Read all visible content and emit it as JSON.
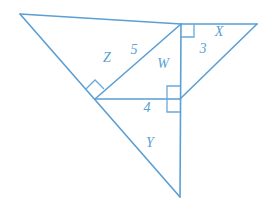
{
  "figure": {
    "name": "geometry-diagram-right-triangles",
    "stroke_color": "#5b9fd4",
    "background_color": "#ffffff",
    "labels": [
      {
        "id": "Z",
        "text": "Z",
        "x": 107,
        "y": 58,
        "kind": "variable"
      },
      {
        "id": "5",
        "text": "5",
        "x": 134,
        "y": 50,
        "kind": "measure"
      },
      {
        "id": "W",
        "text": "W",
        "x": 163,
        "y": 64,
        "kind": "variable"
      },
      {
        "id": "X",
        "text": "X",
        "x": 219,
        "y": 32,
        "kind": "variable"
      },
      {
        "id": "3",
        "text": "3",
        "x": 203,
        "y": 49,
        "kind": "measure"
      },
      {
        "id": "4",
        "text": "4",
        "x": 147,
        "y": 108,
        "kind": "measure"
      },
      {
        "id": "Y",
        "text": "Y",
        "x": 150,
        "y": 143,
        "kind": "variable"
      }
    ],
    "vertices": {
      "A_top_left": {
        "x": 20,
        "y": 14
      },
      "B_apex": {
        "x": 181,
        "y": 24
      },
      "C_top_right": {
        "x": 257,
        "y": 24
      },
      "D_left_interior": {
        "x": 95,
        "y": 99
      },
      "E_center": {
        "x": 180,
        "y": 99
      },
      "F_bottom": {
        "x": 180,
        "y": 197
      }
    },
    "segments": [
      {
        "name": "top-edge",
        "from": "A_top_left",
        "to": "B_apex"
      },
      {
        "name": "top-right-edge",
        "from": "B_apex",
        "to": "C_top_right"
      },
      {
        "name": "long-left-diagonal",
        "from": "A_top_left",
        "to": "F_bottom"
      },
      {
        "name": "vertical-altitude",
        "from": "B_apex",
        "to": "F_bottom"
      },
      {
        "name": "right-diagonal",
        "from": "C_top_right",
        "to": "E_center"
      },
      {
        "name": "hypotenuse-5",
        "from": "D_left_interior",
        "to": "B_apex"
      },
      {
        "name": "base-4",
        "from": "D_left_interior",
        "to": "E_center"
      }
    ],
    "right_angle_marks": [
      {
        "name": "right-angle-apex",
        "at": "B_apex"
      },
      {
        "name": "right-angle-left-interior",
        "at": "D_left_interior"
      },
      {
        "name": "right-angle-center-upper",
        "at": "E_center"
      },
      {
        "name": "right-angle-center-lower",
        "at": "E_center"
      }
    ]
  }
}
